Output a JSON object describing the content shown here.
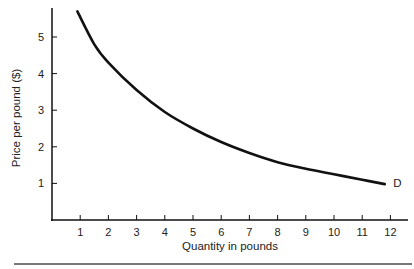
{
  "chart_data": {
    "type": "line",
    "title": "",
    "xlabel": "Quantity in pounds",
    "ylabel": "Price per pound ($)",
    "x_ticks": [
      "1",
      "2",
      "3",
      "4",
      "5",
      "6",
      "7",
      "8",
      "9",
      "10",
      "11",
      "12"
    ],
    "y_ticks": [
      "1",
      "2",
      "3",
      "4",
      "5"
    ],
    "xlim": [
      0,
      12.6
    ],
    "ylim": [
      0,
      5.9
    ],
    "grid": false,
    "series": [
      {
        "name": "D",
        "x": [
          0.9,
          1.5,
          2,
          3,
          4,
          5,
          6,
          7,
          8,
          9,
          10,
          11,
          11.8
        ],
        "values": [
          5.7,
          4.8,
          4.3,
          3.55,
          2.95,
          2.5,
          2.13,
          1.83,
          1.58,
          1.4,
          1.25,
          1.1,
          0.98
        ]
      }
    ],
    "annotations": [
      {
        "text": "D",
        "x": 12.1,
        "y": 1.0
      }
    ]
  }
}
